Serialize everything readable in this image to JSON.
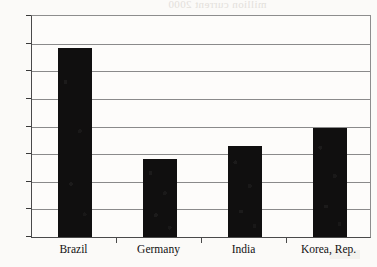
{
  "background_ghost_text": "million current 2000",
  "colors": {
    "bar": "#100f0f",
    "gridline": "#8a8a8a",
    "axis": "#3a3a3a",
    "paper": "#fbfaf8",
    "plot_area": "#fdfcfa",
    "text": "#111111"
  },
  "chart_data": {
    "type": "bar",
    "title": "",
    "xlabel": "",
    "ylabel": "",
    "categories": [
      "Brazil",
      "Germany",
      "India",
      "Korea, Rep."
    ],
    "values": [
      13.7,
      5.65,
      6.6,
      7.9
    ],
    "ylim": [
      0,
      16
    ],
    "ytick_labels": [
      "0",
      "2",
      "4",
      "6",
      "8",
      "10",
      "12",
      "14",
      "16"
    ],
    "ytick_values": [
      0,
      2,
      4,
      6,
      8,
      10,
      12,
      14,
      16
    ],
    "grid": true,
    "legend": false,
    "legend_position": "none"
  }
}
